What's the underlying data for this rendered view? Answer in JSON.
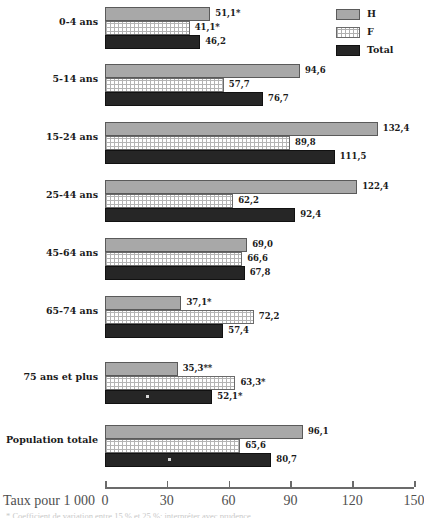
{
  "chart_data": {
    "type": "bar",
    "orientation": "horizontal",
    "title": "",
    "xlabel": "Taux pour 1 000",
    "ylabel": "",
    "xlim": [
      0,
      150
    ],
    "xticks": [
      0,
      30,
      60,
      90,
      120,
      150
    ],
    "grid": false,
    "legend_position": "top-right",
    "categories": [
      "0-4 ans",
      "5-14 ans",
      "15-24 ans",
      "25-44 ans",
      "45-64 ans",
      "65-74 ans",
      "75 ans et plus",
      "Population totale"
    ],
    "series": [
      {
        "name": "H",
        "values": [
          51.1,
          94.6,
          132.4,
          122.4,
          69.0,
          37.1,
          35.3,
          96.1
        ],
        "labels": [
          "51,1*",
          "94,6",
          "132,4",
          "122,4",
          "69,0",
          "37,1*",
          "35,3**",
          "96,1"
        ],
        "color": "#a8a8a8",
        "fill": "solid-grey"
      },
      {
        "name": "F",
        "values": [
          41.1,
          57.7,
          89.8,
          62.2,
          66.6,
          72.2,
          63.3,
          65.6
        ],
        "labels": [
          "41,1*",
          "57,7",
          "89,8",
          "62,2",
          "66,6",
          "72,2",
          "63,3*",
          "65,6"
        ],
        "color": "#ffffff",
        "fill": "checkered-pattern"
      },
      {
        "name": "Total",
        "values": [
          46.2,
          76.7,
          111.5,
          92.4,
          67.8,
          57.4,
          52.1,
          80.7
        ],
        "labels": [
          "46,2",
          "76,7",
          "111,5",
          "92,4",
          "67,8",
          "57,4",
          "52,1*",
          "80,7"
        ],
        "color": "#262626",
        "fill": "solid-black"
      }
    ]
  },
  "legend": {
    "items": [
      {
        "label": "H",
        "swatch": "solid-grey"
      },
      {
        "label": "F",
        "swatch": "checkered-pattern"
      },
      {
        "label": "Total",
        "swatch": "solid-black"
      }
    ]
  },
  "axis": {
    "title": "Taux pour 1 000",
    "ticks": [
      "0",
      "30",
      "60",
      "90",
      "120",
      "150"
    ]
  },
  "footnote": {
    "text": "*  Coefficient de variation entre 15 % et 25 %; interpréter avec prudence."
  }
}
